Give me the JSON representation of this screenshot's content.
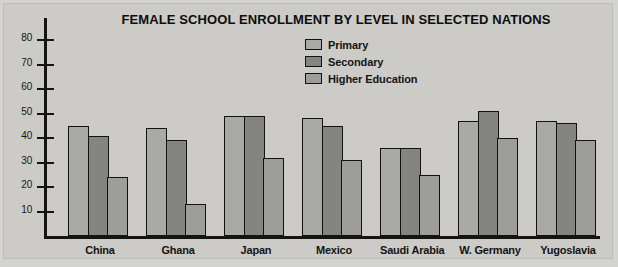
{
  "chart_data": {
    "type": "bar",
    "title": "FEMALE SCHOOL ENROLLMENT BY LEVEL IN SELECTED NATIONS",
    "xlabel": "",
    "ylabel": "Percentage of females in total enrollment",
    "ylim": [
      0,
      80
    ],
    "ytick_labels": [
      "80",
      "70",
      "60",
      "50",
      "40",
      "30",
      "20",
      "10"
    ],
    "yticks": [
      80,
      70,
      60,
      50,
      40,
      30,
      20,
      10
    ],
    "grid": false,
    "legend_position": "top-center",
    "categories": [
      "China",
      "Ghana",
      "Japan",
      "Mexico",
      "Saudi Arabia",
      "W. Germany",
      "Yugoslavia"
    ],
    "series": [
      {
        "name": "Primary",
        "color": "#a9a9a7",
        "values": [
          45,
          44,
          49,
          48,
          36,
          47,
          47
        ]
      },
      {
        "name": "Secondary",
        "color": "#848483",
        "values": [
          41,
          39,
          49,
          45,
          36,
          51,
          46
        ]
      },
      {
        "name": "Higher Education",
        "color": "#9d9d9b",
        "values": [
          24,
          13,
          32,
          31,
          25,
          40,
          39
        ]
      }
    ]
  },
  "colors": {
    "background": "#cccbc8",
    "axis": "#141414",
    "text": "#141414",
    "primary": "#a9a9a7",
    "secondary": "#848483",
    "higher_education": "#9d9d9b"
  }
}
